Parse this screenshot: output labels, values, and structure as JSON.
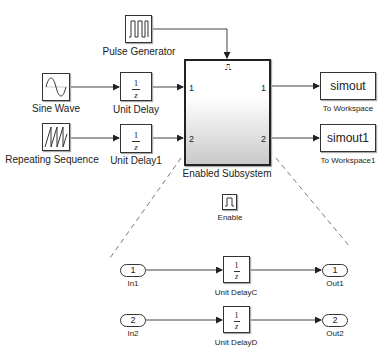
{
  "diagram": {
    "top_level": {
      "sources": [
        {
          "name": "Pulse Generator",
          "icon": "pulse-icon"
        },
        {
          "name": "Sine Wave",
          "icon": "sine-icon"
        },
        {
          "name": "Repeating Sequence",
          "icon": "sawtooth-icon"
        }
      ],
      "delays": [
        {
          "name": "Unit Delay",
          "num": "1",
          "den": "z"
        },
        {
          "name": "Unit Delay1",
          "num": "1",
          "den": "z"
        }
      ],
      "subsystem": {
        "name": "Enabled Subsystem",
        "enable_glyph": "⎍",
        "in_ports": [
          "1",
          "2"
        ],
        "out_ports": [
          "1",
          "2"
        ]
      },
      "sinks": [
        {
          "name": "To Workspace",
          "variable": "simout"
        },
        {
          "name": "To Workspace1",
          "variable": "simout1"
        }
      ]
    },
    "subsystem_contents": {
      "enable": {
        "name": "Enable"
      },
      "inports": [
        {
          "name": "In1",
          "number": "1"
        },
        {
          "name": "In2",
          "number": "2"
        }
      ],
      "delays": [
        {
          "name": "Unit DelayC",
          "num": "1",
          "den": "z"
        },
        {
          "name": "Unit DelayD",
          "num": "1",
          "den": "z"
        }
      ],
      "outports": [
        {
          "name": "Out1",
          "number": "1"
        },
        {
          "name": "Out2",
          "number": "2"
        }
      ]
    }
  }
}
